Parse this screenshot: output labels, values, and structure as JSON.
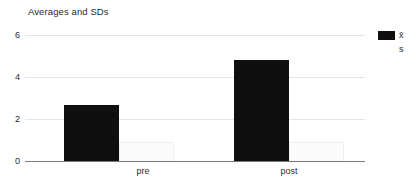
{
  "chart_data": {
    "type": "bar",
    "title": "Averages and SDs",
    "xlabel": "",
    "ylabel": "",
    "categories": [
      "pre",
      "post"
    ],
    "series": [
      {
        "name": "x̄",
        "values": [
          2.95,
          5.3
        ],
        "color": "#0f0f0f"
      },
      {
        "name": "s",
        "values": [
          1.0,
          1.0
        ],
        "color": "#fbfbfb"
      }
    ],
    "ylim": [
      0,
      6.6
    ],
    "yticks": [
      0,
      2,
      4,
      6
    ],
    "ytick_labels": [
      "0",
      "2",
      "4",
      "6"
    ],
    "grid": true,
    "legend_position": "right"
  },
  "axis": {
    "y_labels": {
      "t6": "6",
      "t4": "4",
      "t2": "2",
      "t0": "0"
    },
    "x_labels": {
      "pre": "pre",
      "post": "post"
    }
  },
  "legend": {
    "mean_label": "x̄",
    "sd_label": "s"
  },
  "colors": {
    "mean_bar": "#0f0f0f",
    "sd_bar": "#fbfbfb",
    "gridline": "#e4e4e4",
    "axis": "#7a7a7a",
    "text": "#2b2b2b",
    "background": "#ffffff"
  }
}
